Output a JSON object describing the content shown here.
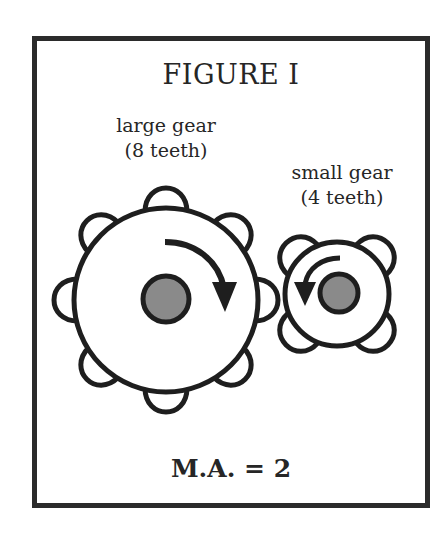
{
  "figure": {
    "title": "FIGURE I",
    "large_gear": {
      "label_line1": "large gear",
      "label_line2": "(8 teeth)",
      "teeth": 8,
      "rotation": "clockwise"
    },
    "small_gear": {
      "label_line1": "small gear",
      "label_line2": "(4 teeth)",
      "teeth": 4,
      "rotation": "counter-clockwise"
    },
    "mechanical_advantage": "M.A. = 2"
  },
  "colors": {
    "stroke": "#1e1e1e",
    "hub_fill": "#8a8a8a",
    "frame": "#2b2b2b",
    "background": "#ffffff"
  }
}
